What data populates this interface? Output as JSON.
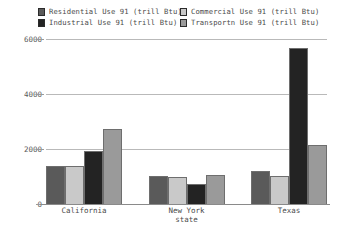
{
  "chart_data": {
    "type": "bar",
    "title": "",
    "xlabel": "state",
    "ylabel": "",
    "categories": [
      "California",
      "New York",
      "Texas"
    ],
    "series": [
      {
        "name": "Residential Use 91 (trill Btu)",
        "color": "#5a5a5a",
        "values": [
          1390,
          1000,
          1200
        ]
      },
      {
        "name": "Commercial Use 91 (trill Btu)",
        "color": "#c9c9c9",
        "values": [
          1370,
          990,
          1020
        ]
      },
      {
        "name": "Industrial Use 91 (trill Btu)",
        "color": "#232323",
        "values": [
          1940,
          740,
          5650
        ]
      },
      {
        "name": "Transportn Use 91 (trill Btu)",
        "color": "#9a9a9a",
        "values": [
          2720,
          1060,
          2130
        ]
      }
    ],
    "ylim": [
      0,
      6200
    ],
    "yticks": [
      0,
      2000,
      4000,
      6000
    ],
    "ytick_labels": [
      "0",
      "2000",
      "4000",
      "6000"
    ],
    "grid": true,
    "legend_position": "top",
    "legend_columns": 2
  },
  "legend": {
    "entries": [
      {
        "label": "Residential Use 91 (trill Btu)"
      },
      {
        "label": "Commercial Use 91 (trill Btu)"
      },
      {
        "label": "Industrial Use 91 (trill Btu)"
      },
      {
        "label": "Transportn Use 91 (trill Btu)"
      }
    ]
  }
}
